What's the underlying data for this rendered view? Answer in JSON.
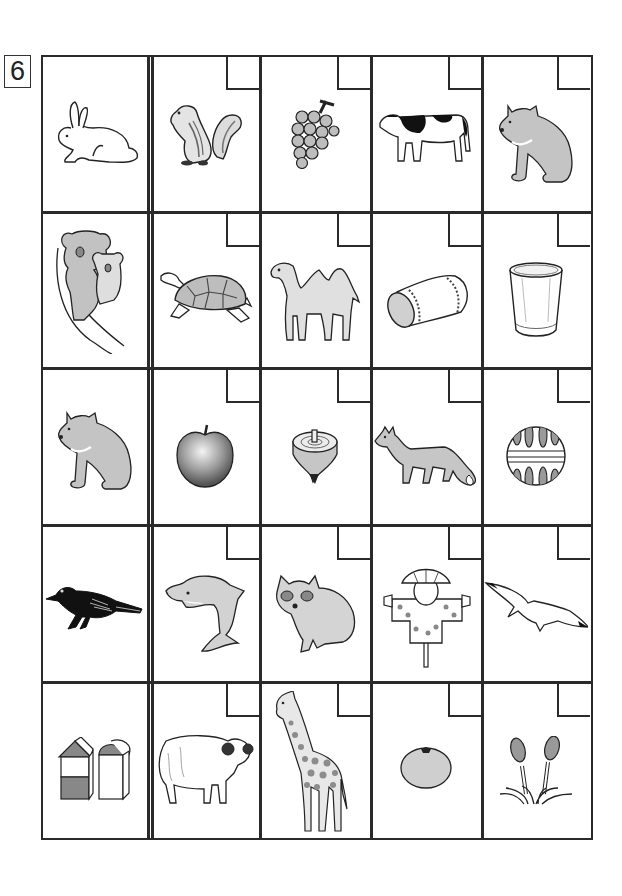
{
  "worksheet": {
    "question_number": "6",
    "columns": 5,
    "rows": 5,
    "first_column_is_example": true,
    "answer_box_color": "#ffffff",
    "line_color": "#2a2a2a",
    "fill_gray": "#c8c8c8"
  },
  "cells": [
    [
      {
        "item": "rabbit",
        "answer_box": false
      },
      {
        "item": "chipmunk",
        "answer_box": true
      },
      {
        "item": "grapes",
        "answer_box": true
      },
      {
        "item": "cow",
        "answer_box": true
      },
      {
        "item": "bear",
        "answer_box": true
      }
    ],
    [
      {
        "item": "koala",
        "answer_box": false
      },
      {
        "item": "tortoise",
        "answer_box": true
      },
      {
        "item": "camel",
        "answer_box": true
      },
      {
        "item": "pillow",
        "answer_box": true
      },
      {
        "item": "glass",
        "answer_box": true
      }
    ],
    [
      {
        "item": "bear",
        "answer_box": false
      },
      {
        "item": "apple",
        "answer_box": true
      },
      {
        "item": "spinning top",
        "answer_box": true
      },
      {
        "item": "fox",
        "answer_box": true
      },
      {
        "item": "ball",
        "answer_box": true
      }
    ],
    [
      {
        "item": "crow",
        "answer_box": false
      },
      {
        "item": "dolphin",
        "answer_box": true
      },
      {
        "item": "raccoon dog",
        "answer_box": true
      },
      {
        "item": "scarecrow",
        "answer_box": true
      },
      {
        "item": "seagull",
        "answer_box": true
      }
    ],
    [
      {
        "item": "building blocks",
        "answer_box": false
      },
      {
        "item": "sheep",
        "answer_box": true
      },
      {
        "item": "giraffe",
        "answer_box": true
      },
      {
        "item": "mandarin orange",
        "answer_box": true
      },
      {
        "item": "horsetail shoots",
        "answer_box": true
      }
    ]
  ]
}
